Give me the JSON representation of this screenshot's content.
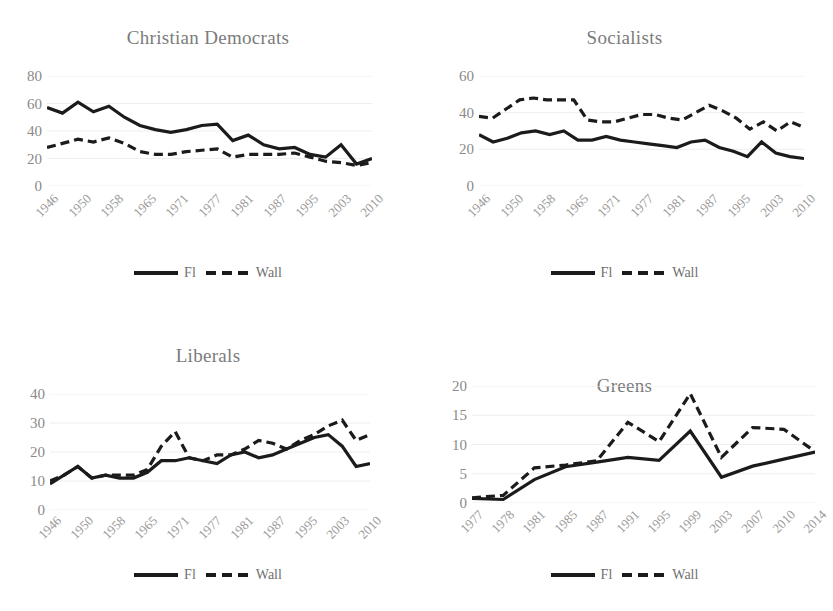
{
  "figure": {
    "background": "#ffffff",
    "line_color": "#1b1b1b",
    "title_color": "#7b7b7b",
    "tick_color": "#9a9a9a",
    "grid_color": "#eeeeee"
  },
  "legend": {
    "series_solid_label": "Fl",
    "series_dashed_label": "Wall"
  },
  "chart_data": [
    {
      "type": "line",
      "title": "Christian Democrats",
      "xlabel": "",
      "ylabel": "",
      "ylim": [
        0,
        80
      ],
      "yticks": [
        0,
        20,
        40,
        60,
        80
      ],
      "grid": true,
      "legend_position": "bottom",
      "categories": [
        "1946",
        "1950",
        "1958",
        "1965",
        "1971",
        "1977",
        "1981",
        "1987",
        "1995",
        "2003",
        "2010"
      ],
      "x": [
        "1946",
        "1949",
        "1950",
        "1954",
        "1958",
        "1961",
        "1965",
        "1968",
        "1971",
        "1974",
        "1977",
        "1978",
        "1981",
        "1985",
        "1987",
        "1991",
        "1995",
        "1999",
        "2003",
        "2007",
        "2010",
        "2014"
      ],
      "series": [
        {
          "name": "Fl",
          "style": "solid",
          "values": [
            57,
            53,
            61,
            54,
            58,
            50,
            44,
            41,
            39,
            41,
            44,
            45,
            33,
            37,
            30,
            27,
            28,
            23,
            21,
            30,
            16,
            20
          ]
        },
        {
          "name": "Wall",
          "style": "dashed",
          "values": [
            28,
            31,
            34,
            32,
            35,
            31,
            25,
            23,
            23,
            25,
            26,
            27,
            21,
            23,
            23,
            23,
            24,
            21,
            18,
            17,
            15,
            17
          ]
        }
      ]
    },
    {
      "type": "line",
      "title": "Socialists",
      "xlabel": "",
      "ylabel": "",
      "ylim": [
        0,
        60
      ],
      "yticks": [
        0,
        20,
        40,
        60
      ],
      "grid": true,
      "legend_position": "bottom",
      "categories": [
        "1946",
        "1950",
        "1958",
        "1965",
        "1971",
        "1977",
        "1981",
        "1987",
        "1995",
        "2003",
        "2010"
      ],
      "x": [
        "1946",
        "1949",
        "1950",
        "1954",
        "1958",
        "1961",
        "1965",
        "1968",
        "1971",
        "1974",
        "1977",
        "1978",
        "1981",
        "1985",
        "1987",
        "1991",
        "1995",
        "1999",
        "2003",
        "2007",
        "2010",
        "2014"
      ],
      "series": [
        {
          "name": "Fl",
          "style": "solid",
          "values": [
            28,
            24,
            26,
            29,
            30,
            28,
            30,
            25,
            25,
            27,
            25,
            24,
            23,
            22,
            21,
            24,
            25,
            21,
            19,
            16,
            24,
            18,
            16,
            15
          ]
        },
        {
          "name": "Wall",
          "style": "dashed",
          "values": [
            38,
            37,
            42,
            47,
            48,
            47,
            47,
            47,
            36,
            35,
            35,
            37,
            39,
            39,
            37,
            36,
            40,
            44,
            41,
            37,
            31,
            35,
            30,
            35,
            32
          ]
        }
      ]
    },
    {
      "type": "line",
      "title": "Liberals",
      "xlabel": "",
      "ylabel": "",
      "ylim": [
        0,
        40
      ],
      "yticks": [
        0,
        10,
        20,
        30,
        40
      ],
      "grid": true,
      "legend_position": "bottom",
      "categories": [
        "1946",
        "1950",
        "1958",
        "1965",
        "1971",
        "1977",
        "1981",
        "1987",
        "1995",
        "2003",
        "2010"
      ],
      "x": [
        "1946",
        "1949",
        "1950",
        "1954",
        "1958",
        "1961",
        "1965",
        "1968",
        "1971",
        "1974",
        "1977",
        "1978",
        "1981",
        "1985",
        "1987",
        "1991",
        "1995",
        "1999",
        "2003",
        "2007",
        "2010",
        "2014"
      ],
      "series": [
        {
          "name": "Fl",
          "style": "solid",
          "values": [
            9,
            12,
            15,
            11,
            12,
            11,
            11,
            13,
            17,
            17,
            18,
            17,
            16,
            19,
            20,
            18,
            19,
            21,
            23,
            25,
            26,
            22,
            15,
            16
          ]
        },
        {
          "name": "Wall",
          "style": "dashed",
          "values": [
            10,
            12,
            15,
            11,
            12,
            12,
            12,
            14,
            22,
            27,
            18,
            17,
            19,
            19,
            21,
            24,
            23,
            21,
            24,
            26,
            29,
            31,
            24,
            26
          ]
        }
      ]
    },
    {
      "type": "line",
      "title": "Greens",
      "xlabel": "",
      "ylabel": "",
      "ylim": [
        0,
        20
      ],
      "yticks": [
        0,
        5,
        10,
        15,
        20
      ],
      "grid": true,
      "legend_position": "bottom",
      "categories": [
        "1977",
        "1978",
        "1981",
        "1985",
        "1987",
        "1991",
        "1995",
        "1999",
        "2003",
        "2007",
        "2010",
        "2014"
      ],
      "x": [
        "1977",
        "1978",
        "1981",
        "1985",
        "1987",
        "1991",
        "1995",
        "1999",
        "2003",
        "2007",
        "2010",
        "2014"
      ],
      "series": [
        {
          "name": "Fl",
          "style": "solid",
          "values": [
            0.8,
            0.6,
            4.0,
            6.2,
            7.0,
            7.8,
            7.3,
            12.3,
            4.4,
            6.3,
            7.5,
            8.7
          ]
        },
        {
          "name": "Wall",
          "style": "dashed",
          "values": [
            0.9,
            1.3,
            6.0,
            6.5,
            7.2,
            13.8,
            10.5,
            18.7,
            7.8,
            12.9,
            12.6,
            8.8
          ]
        }
      ]
    }
  ]
}
